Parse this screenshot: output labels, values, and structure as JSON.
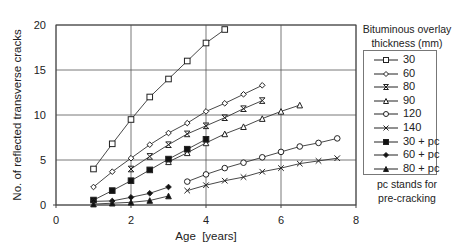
{
  "chart_data": {
    "type": "line",
    "title": "",
    "xlabel": "Age  [years]",
    "ylabel": "No. of reflected transverse cracks",
    "xlim": [
      0,
      8
    ],
    "ylim": [
      0,
      20
    ],
    "xticks": [
      0,
      2,
      4,
      6,
      8
    ],
    "yticks": [
      0,
      5,
      10,
      15,
      20
    ],
    "grid": "horizontal and vertical major gridlines",
    "legend_title": "Bituminous overlay thickness (mm)",
    "legend_position": "right",
    "annotation": "pc stands for pre-cracking",
    "series": [
      {
        "name": "30",
        "marker": "open-square",
        "x": [
          1,
          1.5,
          2,
          2.5,
          3,
          3.5,
          4,
          4.5
        ],
        "y": [
          4,
          6.8,
          9.5,
          12,
          14,
          16,
          18,
          19.5
        ]
      },
      {
        "name": "60",
        "marker": "open-diamond",
        "x": [
          1,
          1.5,
          2,
          2.5,
          3,
          3.5,
          4,
          4.5,
          5,
          5.5
        ],
        "y": [
          2,
          3.7,
          5.2,
          6.7,
          8,
          9.1,
          10.4,
          11.3,
          12.3,
          13.3
        ]
      },
      {
        "name": "80",
        "marker": "asterisk",
        "x": [
          2,
          2.5,
          3,
          3.5,
          4,
          4.5,
          5,
          5.5
        ],
        "y": [
          4,
          5.4,
          6.7,
          7.9,
          8.8,
          9.7,
          10.7,
          11.6
        ]
      },
      {
        "name": "90",
        "marker": "open-triangle",
        "x": [
          3,
          3.5,
          4,
          4.5,
          5,
          5.5,
          6,
          6.5
        ],
        "y": [
          4.8,
          5.8,
          6.9,
          7.9,
          8.7,
          9.6,
          10.4,
          11.1
        ]
      },
      {
        "name": "120",
        "marker": "open-circle",
        "x": [
          3.5,
          4,
          4.5,
          5,
          5.5,
          6,
          6.5,
          7,
          7.5
        ],
        "y": [
          2.6,
          3.4,
          4.1,
          4.7,
          5.3,
          5.9,
          6.5,
          6.9,
          7.4
        ]
      },
      {
        "name": "140",
        "marker": "x",
        "x": [
          3.5,
          4,
          4.5,
          5,
          5.5,
          6,
          6.5,
          7,
          7.5
        ],
        "y": [
          1.6,
          2.2,
          2.7,
          3.1,
          3.7,
          4.1,
          4.6,
          4.9,
          5.2
        ]
      },
      {
        "name": "30 + pc",
        "marker": "filled-square",
        "x": [
          1,
          1.5,
          2,
          2.5,
          3,
          3.5,
          4
        ],
        "y": [
          0.55,
          1.6,
          2.7,
          3.9,
          5.1,
          6.2,
          7.3
        ]
      },
      {
        "name": "60 + pc",
        "marker": "filled-diamond",
        "x": [
          1,
          1.5,
          2,
          2.5,
          3
        ],
        "y": [
          0.4,
          0.45,
          0.85,
          1.3,
          2.0
        ]
      },
      {
        "name": "80 + pc",
        "marker": "filled-triangle",
        "x": [
          1,
          1.5,
          2,
          2.5,
          3
        ],
        "y": [
          0.1,
          0.2,
          0.3,
          0.5,
          1.0
        ]
      }
    ]
  },
  "legend": {
    "title_line1": "Bituminous overlay",
    "title_line2": "thickness (mm)",
    "note_line1": "pc stands for",
    "note_line2": "pre-cracking"
  },
  "colors": {
    "line": "#333333",
    "grid": "#555555",
    "frame": "#444444",
    "text": "#222222"
  }
}
